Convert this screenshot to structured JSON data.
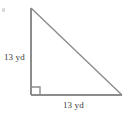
{
  "figure": {
    "name": "right-triangle-diagram",
    "shape": "right triangle",
    "stroke_color": "#8c8c8c",
    "text_color": "#3b3b3b",
    "background_color": "#ffffff"
  },
  "labels": {
    "vertical_leg": "13 yd",
    "horizontal_leg": "13 yd"
  },
  "geometry": {
    "apex": {
      "x": 31,
      "y": 8
    },
    "right_angle_vertex": {
      "x": 31,
      "y": 95
    },
    "base_end_vertex": {
      "x": 122,
      "y": 95
    },
    "right_angle_marker_size": 8
  }
}
